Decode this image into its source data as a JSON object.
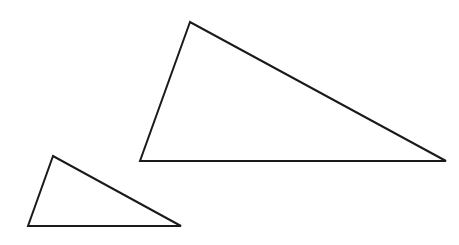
{
  "canvas": {
    "width": 459,
    "height": 245,
    "background": "#ffffff"
  },
  "shapes": [
    {
      "id": "large-triangle",
      "type": "triangle",
      "points": [
        [
          190,
          22
        ],
        [
          140,
          161
        ],
        [
          446,
          161
        ]
      ],
      "stroke": "#1a1a1a",
      "stroke_width": 2
    },
    {
      "id": "small-triangle",
      "type": "triangle",
      "points": [
        [
          53,
          156
        ],
        [
          28,
          226
        ],
        [
          181,
          226
        ]
      ],
      "stroke": "#1a1a1a",
      "stroke_width": 2
    }
  ]
}
